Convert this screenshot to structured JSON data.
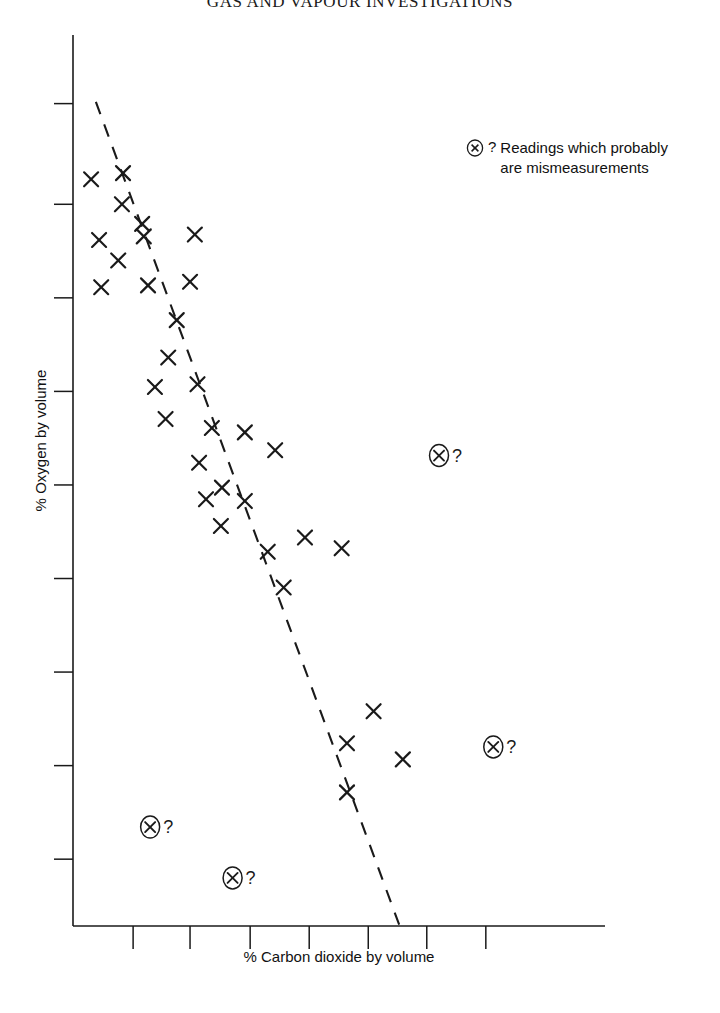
{
  "title": "GAS AND VAPOUR INVESTIGATIONS",
  "legend": {
    "marker_icon": "circled-x-icon",
    "question_mark": "?",
    "text": "Readings which probably\nare mismeasurements"
  },
  "axes": {
    "xlabel": "% Carbon dioxide by volume",
    "ylabel": "% Oxygen by volume",
    "x_tick_count": 7,
    "y_tick_count": 8,
    "x_tick_labels": [],
    "y_tick_labels": [],
    "axis_color": "#1a1a1a"
  },
  "chart_data": {
    "type": "scatter",
    "title": "GAS AND VAPOUR INVESTIGATIONS",
    "xlabel": "% Carbon dioxide by volume",
    "ylabel": "% Oxygen by volume",
    "grid": false,
    "legend_position": "top-right",
    "xlim": [
      0,
      100
    ],
    "ylim": [
      0,
      100
    ],
    "x_ticks": [
      11.3,
      22.0,
      33.3,
      44.4,
      55.5,
      66.5,
      77.6
    ],
    "y_ticks": [
      7.5,
      18.0,
      28.5,
      39.0,
      49.5,
      60.0,
      70.5,
      81.0,
      92.3
    ],
    "series": [
      {
        "name": "Readings",
        "marker": "x",
        "color": "#1a1a1a",
        "points": [
          [
            3.4,
            83.8
          ],
          [
            9.4,
            84.5
          ],
          [
            9.2,
            81.0
          ],
          [
            13.0,
            78.8
          ],
          [
            4.9,
            77.0
          ],
          [
            13.3,
            77.4
          ],
          [
            22.9,
            77.6
          ],
          [
            8.5,
            74.7
          ],
          [
            5.3,
            71.7
          ],
          [
            14.1,
            71.9
          ],
          [
            22.0,
            72.3
          ],
          [
            19.5,
            68.0
          ],
          [
            17.9,
            63.8
          ],
          [
            15.4,
            60.5
          ],
          [
            23.4,
            60.8
          ],
          [
            17.4,
            56.9
          ],
          [
            26.1,
            55.9
          ],
          [
            32.3,
            55.4
          ],
          [
            23.7,
            52.0
          ],
          [
            38.0,
            53.4
          ],
          [
            28.0,
            49.2
          ],
          [
            25.0,
            47.9
          ],
          [
            32.3,
            47.7
          ],
          [
            27.8,
            44.9
          ],
          [
            43.6,
            43.6
          ],
          [
            36.6,
            42.0
          ],
          [
            50.5,
            42.4
          ],
          [
            39.6,
            38.0
          ],
          [
            56.5,
            24.1
          ],
          [
            51.5,
            20.5
          ],
          [
            62.0,
            18.7
          ],
          [
            51.5,
            15.0
          ]
        ]
      }
    ],
    "outliers": {
      "name": "Readings which probably are mismeasurements",
      "marker": "circled-x",
      "points": [
        [
          68.8,
          52.8
        ],
        [
          79.0,
          20.1
        ],
        [
          14.5,
          11.1
        ],
        [
          30.0,
          5.4
        ]
      ]
    },
    "trend_line": {
      "style": "dashed",
      "color": "#1a1a1a",
      "from": [
        4.3,
        92.5
      ],
      "to": [
        61.4,
        0.0
      ]
    }
  }
}
